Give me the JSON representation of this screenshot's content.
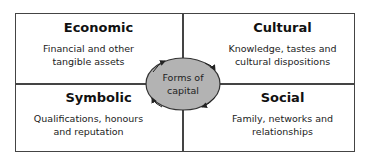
{
  "diagram": {
    "center": {
      "label_line1": "Forms of",
      "label_line2": "capital",
      "fill": "#b3b3b3"
    },
    "quadrants": [
      {
        "title": "Economic",
        "line1": "Financial and other",
        "line2": "tangible assets"
      },
      {
        "title": "Cultural",
        "line1": "Knowledge, tastes and",
        "line2": "cultural dispositions"
      },
      {
        "title": "Symbolic",
        "line1": "Qualifications, honours",
        "line2": "and reputation"
      },
      {
        "title": "Social",
        "line1": "Family, networks and",
        "line2": "relationships"
      }
    ]
  }
}
